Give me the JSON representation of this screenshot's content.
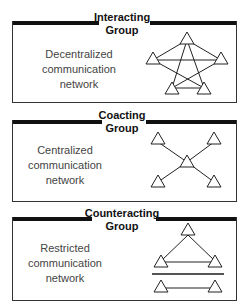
{
  "panels": [
    {
      "title_line1": "Interacting",
      "title_line2": "Group",
      "desc_line1": "Decentralized",
      "desc_line2": "communication",
      "desc_line3": "network",
      "network_type": "decentralized"
    },
    {
      "title_line1": "Coacting",
      "title_line2": "Group",
      "desc_line1": "Centralized",
      "desc_line2": "communication",
      "desc_line3": "network",
      "network_type": "centralized"
    },
    {
      "title_line1": "Counteracting",
      "title_line2": "Group",
      "desc_line1": "Restricted",
      "desc_line2": "communication",
      "desc_line3": "network",
      "network_type": "restricted"
    }
  ]
}
